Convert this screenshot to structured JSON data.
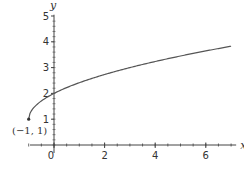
{
  "chart_data": {
    "type": "line",
    "title": "",
    "xlabel": "x",
    "ylabel": "y",
    "xlim": [
      -1.2,
      7.2
    ],
    "ylim": [
      -0.5,
      5.1
    ],
    "x_ticks": [
      "0",
      "2",
      "4",
      "6"
    ],
    "y_ticks": [
      "1",
      "2",
      "3",
      "4",
      "5"
    ],
    "grid": false,
    "legend": null,
    "series": [
      {
        "name": "y = 1 + sqrt(x + 1)",
        "x": [
          -1,
          -0.75,
          -0.5,
          0,
          0.5,
          1,
          2,
          3,
          4,
          5,
          6,
          7
        ],
        "y": [
          1,
          1.5,
          1.71,
          2,
          2.22,
          2.41,
          2.73,
          3,
          3.24,
          3.45,
          3.65,
          3.83
        ]
      }
    ],
    "annotations": [
      {
        "text": "(−1, 1)",
        "x": -1,
        "y": 1,
        "marker": "point"
      }
    ]
  }
}
